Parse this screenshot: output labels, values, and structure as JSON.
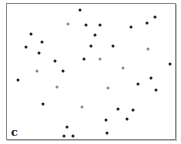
{
  "panel": {
    "label": "c"
  },
  "colors": {
    "dark": "#222222",
    "gray": "#8c8c8c",
    "frame": "#8a8a8a"
  },
  "chart_data": {
    "type": "scatter",
    "title": "",
    "xlabel": "",
    "ylabel": "",
    "grid": false,
    "legend": null,
    "annotations": [
      "c"
    ],
    "coordinate_space": "pixel positions within 181x144 image",
    "series": [
      {
        "name": "dark",
        "color": "#222222",
        "points": [
          [
            80,
            10
          ],
          [
            86,
            25
          ],
          [
            100,
            25
          ],
          [
            131,
            27
          ],
          [
            147,
            23
          ],
          [
            155,
            17
          ],
          [
            31,
            34
          ],
          [
            95,
            35
          ],
          [
            26,
            47
          ],
          [
            42,
            42
          ],
          [
            39,
            53
          ],
          [
            91,
            46
          ],
          [
            113,
            46
          ],
          [
            55,
            61
          ],
          [
            84,
            59
          ],
          [
            63,
            71
          ],
          [
            18,
            80
          ],
          [
            170,
            64
          ],
          [
            151,
            78
          ],
          [
            138,
            84
          ],
          [
            156,
            90
          ],
          [
            43,
            104
          ],
          [
            118,
            109
          ],
          [
            133,
            110
          ],
          [
            106,
            120
          ],
          [
            127,
            119
          ],
          [
            67,
            127
          ],
          [
            64,
            136
          ],
          [
            73,
            136
          ],
          [
            107,
            133
          ]
        ]
      },
      {
        "name": "gray",
        "color": "#8c8c8c",
        "points": [
          [
            68,
            24
          ],
          [
            148,
            49
          ],
          [
            100,
            59
          ],
          [
            37,
            71
          ],
          [
            123,
            68
          ],
          [
            57,
            87
          ],
          [
            108,
            88
          ],
          [
            82,
            107
          ]
        ]
      }
    ]
  }
}
